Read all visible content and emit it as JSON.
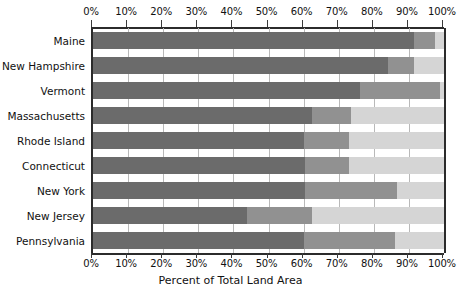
{
  "chart_data": {
    "type": "bar",
    "orientation": "horizontal",
    "stacked": true,
    "title": "",
    "xlabel": "Percent of Total Land Area",
    "ylabel": "",
    "xlim": [
      0,
      100
    ],
    "grid": true,
    "legend": "none",
    "xticks": [
      "0%",
      "10%",
      "20%",
      "30%",
      "40%",
      "50%",
      "60%",
      "70%",
      "80%",
      "90%",
      "100%"
    ],
    "xtick_values": [
      0,
      10,
      20,
      30,
      40,
      50,
      60,
      70,
      80,
      90,
      100
    ],
    "categories": [
      "Maine",
      "New Hampshire",
      "Vermont",
      "Massachusetts",
      "Rhode Island",
      "Connecticut",
      "New York",
      "New Jersey",
      "Pennsylvania"
    ],
    "series": [
      {
        "name": "segment-1",
        "color": "#6b6b6b",
        "values": [
          91.5,
          84.0,
          76.0,
          62.5,
          60.0,
          60.5,
          60.5,
          44.0,
          60.0
        ]
      },
      {
        "name": "segment-2",
        "color": "#919191",
        "values": [
          6.0,
          7.5,
          23.0,
          11.0,
          13.0,
          12.5,
          26.0,
          18.5,
          26.0
        ]
      },
      {
        "name": "segment-3",
        "color": "#d5d5d5",
        "values": [
          2.5,
          8.5,
          1.0,
          26.5,
          27.0,
          27.0,
          13.5,
          37.5,
          14.0
        ]
      }
    ],
    "cumulative": [
      [
        91.5,
        97.5,
        100.0
      ],
      [
        84.0,
        91.5,
        100.0
      ],
      [
        76.0,
        99.0,
        100.0
      ],
      [
        62.5,
        73.5,
        100.0
      ],
      [
        60.0,
        73.0,
        100.0
      ],
      [
        60.5,
        73.0,
        100.0
      ],
      [
        60.5,
        86.5,
        100.0
      ],
      [
        44.0,
        62.5,
        100.0
      ],
      [
        60.0,
        86.0,
        100.0
      ]
    ]
  },
  "axis": {
    "x_title": "Percent of Total Land Area"
  },
  "colors": {
    "segment_1": "#6b6b6b",
    "segment_2": "#919191",
    "segment_3": "#d5d5d5",
    "axis": "#2b2b2b",
    "gridline": "#b9b9b9",
    "background": "#ffffff"
  }
}
